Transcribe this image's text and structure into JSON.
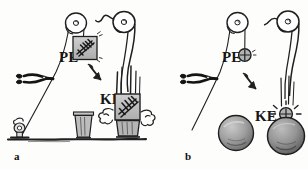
{
  "figure": {
    "background_color": "#fdfdfc",
    "ink_color": "#1a1a1a",
    "fill_gray": "#b8b8b8",
    "fill_gray_dark": "#8a8a8a",
    "fill_light": "#d9d9d9"
  },
  "panels": [
    {
      "id": "a",
      "caption": "a",
      "labels": {
        "pe": "PE",
        "ke": "KE"
      },
      "objects": {
        "pulley_left": "pulley-wheel",
        "pulley_right": "pulley-wheel",
        "rope": "rope-line",
        "scissors": "scissors-cutting-rope",
        "stake": "ground-stake-anchor",
        "ground": "ground-line",
        "weight_raised": "square-block-weight",
        "weight_fallen": "square-block-weight",
        "bucket": "bucket",
        "crushed_bucket": "crushed-bucket",
        "motion_lines": "speed-lines",
        "dust_left": "dust-cloud",
        "dust_right": "dust-cloud",
        "transition_arrow": "curved-down-arrow",
        "cut_rope_end": "severed-rope-end"
      }
    },
    {
      "id": "b",
      "caption": "b",
      "labels": {
        "pe": "PE",
        "ke": "KE"
      },
      "objects": {
        "pulley_left": "pulley-wheel",
        "pulley_right": "pulley-wheel",
        "rope": "rope-line",
        "scissors": "scissors-cutting-rope",
        "weight_raised": "small-round-weight",
        "weight_fallen": "small-round-weight",
        "sphere_intact": "large-sphere",
        "sphere_struck": "large-sphere",
        "impact_lines": "impact-burst-lines",
        "motion_lines": "speed-lines",
        "transition_arrow": "curved-down-arrow",
        "cut_rope_end": "severed-rope-end"
      }
    }
  ]
}
